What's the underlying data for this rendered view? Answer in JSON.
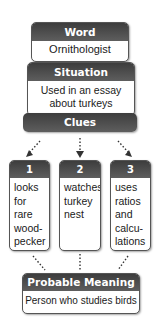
{
  "word": {
    "header": "Word",
    "value": "Ornithologist"
  },
  "situation": {
    "header": "Situation",
    "lines": [
      "Used in an essay",
      "about turkeys"
    ]
  },
  "clues": {
    "header": "Clues",
    "items": [
      {
        "number": "1",
        "lines": [
          "looks",
          "for",
          "rare",
          "wood-",
          "pecker"
        ]
      },
      {
        "number": "2",
        "lines": [
          "watches",
          "turkey",
          "nest"
        ]
      },
      {
        "number": "3",
        "lines": [
          "uses",
          "ratios",
          "and",
          "calcu-",
          "lations"
        ]
      }
    ]
  },
  "meaning": {
    "header": "Probable Meaning",
    "value": "Person who studies birds"
  },
  "colors": {
    "header_dark": "#3d3d3d",
    "header_light": "#5e5e5e",
    "border": "#555555",
    "text": "#1a1a1a"
  }
}
